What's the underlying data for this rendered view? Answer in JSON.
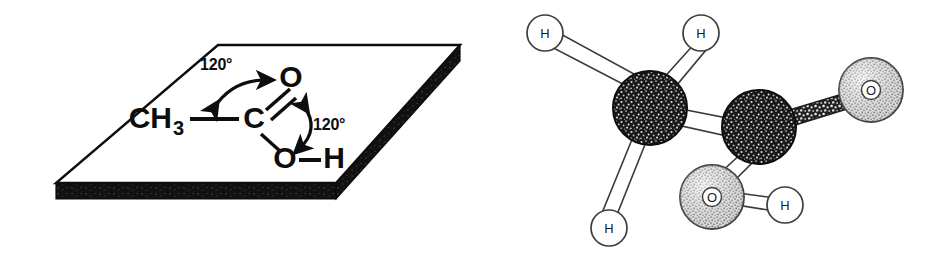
{
  "figure": {
    "background_color": "#ffffff",
    "ink_color": "#0d0d0d",
    "width": 941,
    "height": 259
  },
  "panel_left": {
    "name": "planar-structural-formula-on-slab",
    "caption_note": "Structural formula drawn on a flat plane slab to show the molecule is planar",
    "slab": {
      "face_fill": "#ffffff",
      "edge_color": "#0d0d0d",
      "thickness_fill": "#111111",
      "outline_width": 2
    },
    "formula": {
      "methyl_label": "CH",
      "methyl_subscript": "3",
      "carbonyl_carbon_label": "C",
      "carbonyl_oxygen_label": "O",
      "hydroxyl_oxygen_label": "O",
      "hydroxyl_hydrogen_label": "H",
      "bond_methyl_to_carbon": "single",
      "bond_carbon_to_carbonyl_oxygen": "double",
      "bond_carbon_to_hydroxyl_oxygen": "single",
      "bond_oxygen_to_hydrogen": "single",
      "dash_methyl_bond": "—",
      "dash_oh_bond": "—"
    },
    "angles": [
      {
        "id": "angle-upper",
        "label": "120°",
        "describes": "CH3—C=O bond angle"
      },
      {
        "id": "angle-lower",
        "label": "120°",
        "describes": "O=C—O bond angle"
      }
    ]
  },
  "panel_right": {
    "name": "ball-and-stick-model",
    "caption_note": "Three dimensional ball-and-stick model of acetic acid CH3COOH",
    "styles": {
      "carbon_fill": "#1c1c1c",
      "carbon_texture": "dark-speckled",
      "oxygen_fill": "#d8d8d8",
      "oxygen_texture": "light-stippled",
      "hydrogen_fill": "#ffffff",
      "hydrogen_texture": "plain-outline",
      "bond_fill": "#ffffff",
      "bond_stroke": "#333333",
      "double_bond_fill": "#2a2a2a"
    },
    "atoms": [
      {
        "id": "h1",
        "element": "H",
        "label": "H",
        "role": "methyl hydrogen upper-left",
        "cx": 75,
        "cy": 33,
        "r": 18
      },
      {
        "id": "h2",
        "element": "H",
        "label": "H",
        "role": "methyl hydrogen upper-right",
        "cx": 231,
        "cy": 33,
        "r": 18
      },
      {
        "id": "h3",
        "element": "H",
        "label": "H",
        "role": "methyl hydrogen lower",
        "cx": 139,
        "cy": 228,
        "r": 18
      },
      {
        "id": "c1",
        "element": "C",
        "label": "",
        "role": "methyl carbon",
        "cx": 180,
        "cy": 108,
        "r": 37
      },
      {
        "id": "c2",
        "element": "C",
        "label": "",
        "role": "carboxyl carbon",
        "cx": 289,
        "cy": 127,
        "r": 37
      },
      {
        "id": "o1",
        "element": "O",
        "label": "O",
        "role": "carbonyl oxygen (double bonded)",
        "cx": 401,
        "cy": 90,
        "r": 32
      },
      {
        "id": "o2",
        "element": "O",
        "label": "O",
        "role": "hydroxyl oxygen",
        "cx": 242,
        "cy": 197,
        "r": 32
      },
      {
        "id": "h4",
        "element": "H",
        "label": "H",
        "role": "hydroxyl hydrogen",
        "cx": 315,
        "cy": 205,
        "r": 18
      }
    ],
    "bonds": [
      {
        "from": "c1",
        "to": "h1",
        "order": 1
      },
      {
        "from": "c1",
        "to": "h2",
        "order": 1
      },
      {
        "from": "c1",
        "to": "h3",
        "order": 1
      },
      {
        "from": "c1",
        "to": "c2",
        "order": 1
      },
      {
        "from": "c2",
        "to": "o1",
        "order": 2
      },
      {
        "from": "c2",
        "to": "o2",
        "order": 1
      },
      {
        "from": "o2",
        "to": "h4",
        "order": 1
      }
    ]
  }
}
